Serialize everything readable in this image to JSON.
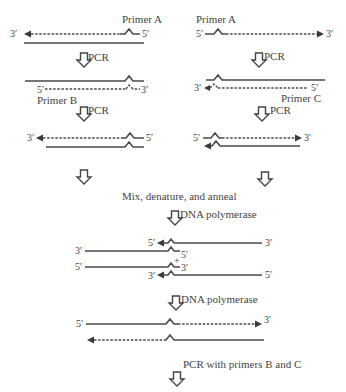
{
  "diagram": {
    "type": "overlap-extension-pcr-mutagenesis",
    "left_column": {
      "step1": {
        "primer_label": "Primer A",
        "left_end": "3′",
        "right_end": "5′"
      },
      "step1_arrow_label": "PCR",
      "step2": {
        "primer_label": "Primer B",
        "left_end": "5′",
        "right_end": "3′"
      },
      "step2_arrow_label": "PCR",
      "step3": {
        "left_end": "3′",
        "right_end": "5′"
      }
    },
    "right_column": {
      "step1": {
        "primer_label": "Primer A",
        "left_end": "5′",
        "right_end": "3′"
      },
      "step1_arrow_label": "PCR",
      "step2": {
        "primer_label": "Primer C",
        "left_end": "3′",
        "right_end": "5′"
      },
      "step2_arrow_label": "PCR",
      "step3": {
        "left_end": "5′",
        "right_end": "3′"
      }
    },
    "merge_label": "Mix, denature, and anneal",
    "polymerase_label_1": "DNA polymerase",
    "heteroduplex": {
      "top_pair": {
        "upper_left": "5′",
        "upper_right": "3′",
        "lower_left": "3′",
        "lower_right": "5′"
      },
      "plus": "+",
      "bottom_pair": {
        "upper_left": "5′",
        "upper_right": "3′",
        "lower_left": "3′",
        "lower_right": "5′"
      }
    },
    "polymerase_label_2": "DNA polymerase",
    "final": {
      "left_end": "5′",
      "right_end": "3′"
    },
    "final_label": "PCR with primers B and C"
  }
}
